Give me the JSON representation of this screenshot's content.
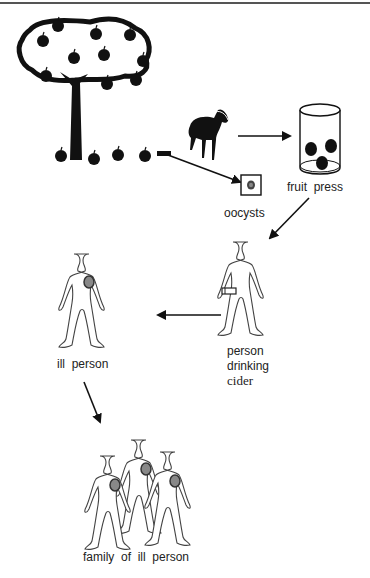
{
  "diagram": {
    "type": "transmission-flow",
    "nodes": [
      {
        "id": "apple-tree",
        "label": "",
        "icon": "apple-tree-icon"
      },
      {
        "id": "calf",
        "label": "",
        "icon": "calf-icon"
      },
      {
        "id": "oocysts",
        "label": "oocysts",
        "icon": "oocyst-icon"
      },
      {
        "id": "fruit-press",
        "label": "fruit  press",
        "icon": "fruit-press-icon"
      },
      {
        "id": "person-drinking",
        "label_lines": [
          "person",
          "drinking",
          "cider"
        ],
        "icon": "person-icon"
      },
      {
        "id": "ill-person",
        "label": "ill  person",
        "icon": "person-icon"
      },
      {
        "id": "family",
        "label": "family  of  ill  person",
        "icon": "group-icon"
      }
    ],
    "edges": [
      {
        "from": "apple-tree",
        "to": "oocysts"
      },
      {
        "from": "calf",
        "to": "fruit-press"
      },
      {
        "from": "fruit-press",
        "to": "person-drinking"
      },
      {
        "from": "person-drinking",
        "to": "ill-person"
      },
      {
        "from": "ill-person",
        "to": "family"
      }
    ],
    "colors": {
      "ink": "#111111",
      "infection_spot": "#888888",
      "outline": "#555555"
    }
  }
}
